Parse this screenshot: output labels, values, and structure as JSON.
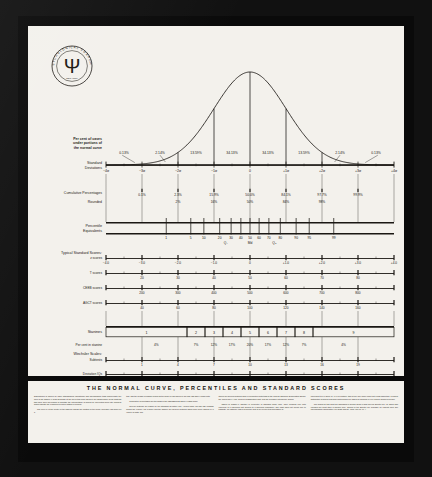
{
  "poster": {
    "logo": {
      "ring_text": "THE PSYCHOLOGICAL CORPORATION",
      "mark": "Ψ",
      "est": "· NEW YORK ·"
    },
    "footer_title": "THE NORMAL CURVE, PERCENTILES AND STANDARD SCORES",
    "footer_columns": [
      [
        "Distributions of scores on many standardized educational and psychological tests approximate the form of the NORMAL CURVE shown at the top of this chart. Below it are shown some of the systems that have been developed to facilitate the interpretation of scores by converting them into numbers which indicate the examinee's relative status in a group.",
        "The zero (0) at the center of the baseline shows the location of the mean (average) raw score on a"
      ],
      [
        "test, and the symbol σ (sigma) marks off the scale of raw scores in STANDARD DEVIATION units.",
        "Cumulative percentages are the basis of the PERCENTILE EQUIVALENT scale.",
        "Several systems are based on the standard deviation unit. Among these STANDARD SCORE scales the z-score, the T-score and the stanine are general systems which have been applied in a variety of tests. The"
      ],
      [
        "others are special systems used in connection with tests of the College Entrance Examination Board, the World War II Army General Classification Test, and the Wechsler intelligence Scales.",
        "Tables of NORMAL whether in percentile or standard score form, have meaning only with reference to a specified test applied to a specified population. The chart does not permit one to translate, for instance, that a percentile rank of 84 on one test necessarily is"
      ],
      [
        "equivalent to a z-score of +1.0 on another, this is true only when each test yields essentially a normal distribution of scores and when both scales are based on identical or very similar groups of people.",
        "The scales on this chart are discussed in greater detail in Test Service Bulletin No. 48, which also includes the chart itself in smaller size. Copies of the Bulletin are available on request from The Psychological Corporation, 304 East 45th St., New York 17, N. Y."
      ]
    ],
    "chart_data": {
      "type": "line",
      "title": "THE NORMAL CURVE, PERCENTILES AND STANDARD SCORES",
      "xlabel": "Standard Deviations",
      "ylabel": "",
      "xlim": [
        -4,
        4
      ],
      "grid": false,
      "legend": "none",
      "curve": {
        "name": "Normal curve",
        "mean": 0,
        "sd": 1
      },
      "curve_vertical_lines": [
        -2,
        -1,
        0,
        1,
        2
      ],
      "rows": [
        {
          "name": "pct_under_curve",
          "label_lines": [
            "Per cent of cases",
            "under portions of",
            "the normal curve"
          ],
          "bands": [
            {
              "from": -4,
              "to": -3,
              "value": "0.13%"
            },
            {
              "from": -3,
              "to": -2,
              "value": "2.14%"
            },
            {
              "from": -2,
              "to": -1,
              "value": "13.59%"
            },
            {
              "from": -1,
              "to": 0,
              "value": "34.13%"
            },
            {
              "from": 0,
              "to": 1,
              "value": "34.13%"
            },
            {
              "from": 1,
              "to": 2,
              "value": "34.13%"
            },
            {
              "from": 2,
              "to": 3,
              "value": "2.14%"
            },
            {
              "from": 3,
              "to": 4,
              "value": "0.13%"
            }
          ],
          "band_labels": [
            "0.13%",
            "2.14%",
            "13.59%",
            "34.13%",
            "34.13%",
            "13.59%",
            "2.14%",
            "0.13%"
          ]
        },
        {
          "name": "standard_deviations",
          "label_lines": [
            "Standard",
            "Deviations"
          ],
          "ticks": [
            -4,
            -3,
            -2,
            -1,
            0,
            1,
            2,
            3,
            4
          ],
          "tick_labels": [
            "−4σ",
            "−3σ",
            "−2σ",
            "−1σ",
            "0",
            "+1σ",
            "+2σ",
            "+3σ",
            "+4σ"
          ]
        },
        {
          "name": "cumulative_percentages",
          "label_lines": [
            "Cumulative Percentages"
          ],
          "ticks": [
            -3,
            -2,
            -1,
            0,
            1,
            2,
            3
          ],
          "tick_labels": [
            "0.1%",
            "2.3%",
            "15.9%",
            "50.0%",
            "84.1%",
            "97.7%",
            "99.9%"
          ]
        },
        {
          "name": "rounded",
          "label_lines": [
            "Rounded"
          ],
          "ticks": [
            -2,
            -1,
            0,
            1,
            2
          ],
          "tick_labels": [
            "2%",
            "16%",
            "50%",
            "84%",
            "98%"
          ]
        },
        {
          "name": "percentile_equivalents",
          "label_lines": [
            "Percentile",
            "Equivalents"
          ],
          "ticks": [
            1,
            5,
            10,
            20,
            30,
            40,
            50,
            60,
            70,
            80,
            90,
            95,
            99
          ],
          "tick_labels": [
            "1",
            "5",
            "10",
            "20",
            "30",
            "40",
            "50",
            "60",
            "70",
            "80",
            "90",
            "95",
            "99"
          ],
          "quartiles": [
            {
              "at": 25,
              "label": "Q₁"
            },
            {
              "at": 50,
              "label": "Md"
            },
            {
              "at": 75,
              "label": "Q₃"
            }
          ]
        },
        {
          "name": "typical_standard_scores_header",
          "label_lines": [
            "Typical Standard Scores:"
          ]
        },
        {
          "name": "z_scores",
          "label_lines": [
            "z scores"
          ],
          "ticks": [
            -4,
            -3,
            -2,
            -1,
            0,
            1,
            2,
            3,
            4
          ],
          "tick_labels": [
            "−4.0",
            "−3.0",
            "−2.0",
            "−1.0",
            "0",
            "+1.0",
            "+2.0",
            "+3.0",
            "+4.0"
          ]
        },
        {
          "name": "T_scores",
          "label_lines": [
            "T scores"
          ],
          "ticks": [
            -3,
            -2,
            -1,
            0,
            1,
            2,
            3
          ],
          "tick_labels": [
            "20",
            "30",
            "40",
            "50",
            "60",
            "70",
            "80"
          ]
        },
        {
          "name": "CEEB_scores",
          "label_lines": [
            "CEEB scores"
          ],
          "ticks": [
            -3,
            -2,
            -1,
            0,
            1,
            2,
            3
          ],
          "tick_labels": [
            "200",
            "300",
            "400",
            "500",
            "600",
            "700",
            "800"
          ]
        },
        {
          "name": "AGCT_scores",
          "label_lines": [
            "AGCT scores"
          ],
          "ticks": [
            -3,
            -2,
            -1,
            0,
            1,
            2,
            3
          ],
          "tick_labels": [
            "40",
            "60",
            "80",
            "100",
            "120",
            "140",
            "160"
          ]
        },
        {
          "name": "stanines",
          "label_lines": [
            "Stanines"
          ],
          "boxes": [
            "1",
            "2",
            "3",
            "4",
            "5",
            "6",
            "7",
            "8",
            "9"
          ],
          "box_edges_sd": [
            -4,
            -1.75,
            -1.25,
            -0.75,
            -0.25,
            0.25,
            0.75,
            1.25,
            1.75,
            4
          ]
        },
        {
          "name": "per_cent_in_stanine",
          "label_lines": [
            "Per cent in stanine"
          ],
          "values": [
            "4%",
            "7%",
            "12%",
            "17%",
            "20%",
            "17%",
            "12%",
            "7%",
            "4%"
          ]
        },
        {
          "name": "wechsler_scales_header",
          "label_lines": [
            "Wechsler Scales:"
          ]
        },
        {
          "name": "wechsler_subtests",
          "label_lines": [
            "Subtests"
          ],
          "ticks": [
            -3,
            -2,
            -1,
            0,
            1,
            2,
            3
          ],
          "tick_labels": [
            "1",
            "4",
            "7",
            "10",
            "13",
            "16",
            "19"
          ]
        },
        {
          "name": "deviation_iqs",
          "label_lines": [
            "Deviation IQs"
          ],
          "ticks": [
            -3,
            -2,
            -1,
            0,
            1,
            2,
            3
          ],
          "tick_labels": [
            "55",
            "70",
            "85",
            "100",
            "115",
            "130",
            "145"
          ]
        }
      ]
    }
  }
}
